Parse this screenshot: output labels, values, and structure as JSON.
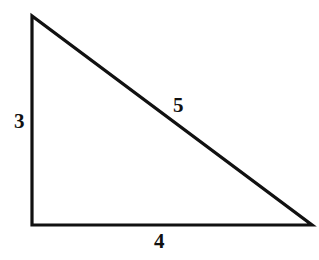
{
  "figure": {
    "kind": "right-triangle-diagram",
    "background_color": "#ffffff",
    "stroke_color": "#111111",
    "stroke_width_px": 3,
    "label_color": "#111111",
    "vertices": {
      "top_left": [
        32,
        16
      ],
      "bottom_left": [
        32,
        225
      ],
      "bottom_right": [
        312,
        225
      ]
    },
    "labels": {
      "vertical_leg": "3",
      "hypotenuse": "5",
      "horizontal_leg": "4"
    }
  }
}
